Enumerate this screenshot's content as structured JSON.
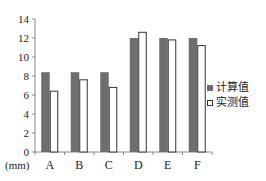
{
  "chart_data": {
    "type": "bar",
    "title": "",
    "xlabel": "(mm)",
    "ylabel": "",
    "categories": [
      "A",
      "B",
      "C",
      "D",
      "E",
      "F"
    ],
    "series": [
      {
        "name": "计算值",
        "color": "#6e6e6e",
        "values": [
          8.4,
          8.4,
          8.4,
          12.0,
          12.0,
          12.0
        ]
      },
      {
        "name": "实测值",
        "color": "#ffffff",
        "values": [
          6.4,
          7.6,
          6.8,
          12.6,
          11.8,
          11.2
        ]
      }
    ],
    "ylim": [
      0,
      14
    ],
    "yticks": [
      0,
      2,
      4,
      6,
      8,
      10,
      12,
      14
    ],
    "grid": false,
    "legend_position": "right"
  },
  "legend": {
    "items": [
      {
        "label": "计算值"
      },
      {
        "label": "实测值"
      }
    ]
  },
  "axis": {
    "unit_label": "(mm)"
  }
}
